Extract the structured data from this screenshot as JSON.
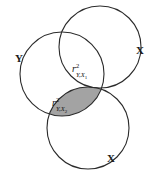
{
  "figure": {
    "type": "venn-diagram",
    "background_color": "#ffffff",
    "stroke_color": "#2b2b2b",
    "shaded_fill_color": "#a3a3a3"
  },
  "labels": {
    "criterion_y": "Y",
    "predictor_x1": "X",
    "predictor_x2": "X"
  },
  "regions": {
    "overlap_y_x1": {
      "symbol": "r",
      "superscript": "2",
      "subscript_main": "Y,X",
      "subscript_index": "1",
      "shaded": "false"
    },
    "overlap_y_x2": {
      "symbol": "r",
      "superscript": "2",
      "subscript_main": "Y,X",
      "subscript_index": "2",
      "shaded": "true"
    }
  },
  "circles": {
    "y_circle": {
      "cx": "62",
      "cy": "74",
      "r": "42"
    },
    "x1_circle": {
      "cx": "100",
      "cy": "47",
      "r": "41"
    },
    "x2_circle": {
      "cx": "88",
      "cy": "128",
      "r": "41"
    }
  }
}
